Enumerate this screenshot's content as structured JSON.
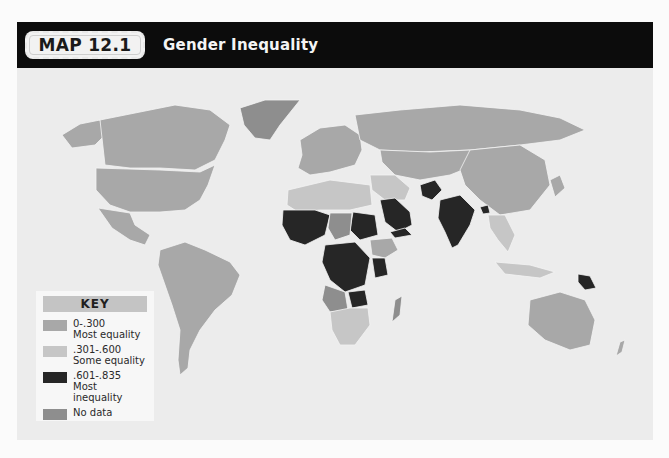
{
  "header": {
    "badge": "MAP 12.1",
    "title": "Gender Inequality"
  },
  "key": {
    "title": "KEY",
    "items": [
      {
        "range": "0-.300",
        "label": "Most equality",
        "color": "#a8a8a8"
      },
      {
        "range": ".301-.600",
        "label": "Some equality",
        "color": "#c6c6c6"
      },
      {
        "range": ".601-.835",
        "label": "Most inequality",
        "color": "#262626"
      },
      {
        "range": "",
        "label": "No data",
        "color": "#8e8e8e"
      }
    ]
  },
  "colors": {
    "header_bg": "#0c0c0c",
    "panel_bg": "#ececec",
    "most_equality": "#a8a8a8",
    "some_equality": "#c6c6c6",
    "most_inequality": "#262626",
    "no_data": "#8e8e8e"
  }
}
